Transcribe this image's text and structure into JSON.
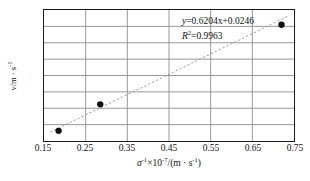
{
  "chart_data": {
    "type": "scatter",
    "title": "",
    "xlabel": "σ⁻¹×10⁻⁷/(m · s⁻¹)",
    "ylabel": "v/m · s⁻¹",
    "xlim": [
      0.15,
      0.75
    ],
    "ylim": [
      0.1,
      0.5
    ],
    "xticks": [
      "0.15",
      "0.25",
      "0.35",
      "0.45",
      "0.55",
      "0.65",
      "0.75"
    ],
    "xtick_values": [
      0.15,
      0.25,
      0.35,
      0.45,
      0.55,
      0.65,
      0.75
    ],
    "yticks": [
      "0.10",
      "0.15",
      "0.20",
      "0.25",
      "0.30",
      "0.35",
      "0.40",
      "0.45",
      "0.50"
    ],
    "ytick_values": [
      0.1,
      0.15,
      0.2,
      0.25,
      0.3,
      0.35,
      0.4,
      0.45,
      0.5
    ],
    "grid": true,
    "legend": "none",
    "points": [
      {
        "x": 0.185,
        "y": 0.131
      },
      {
        "x": 0.285,
        "y": 0.212
      },
      {
        "x": 0.72,
        "y": 0.455
      }
    ],
    "trendline": {
      "style": "dashed",
      "slope": 0.6204,
      "intercept": 0.0246,
      "x_start": 0.165,
      "x_end": 0.735
    },
    "annotations": {
      "equation_y": "y",
      "equation_rest": "=0.6204x+0.0246",
      "r2_symbol": "R",
      "r2_sup": "2",
      "r2_rest": "=0.9963"
    },
    "colors": {
      "frame": "#1a1a1a",
      "grid": "#8c8c8c",
      "marker": "#101010",
      "trend": "#9a9a9a",
      "text": "#111111",
      "background": "#ffffff"
    }
  },
  "axis_text": {
    "y_label_main": "v/m · s",
    "y_label_sup": "-1",
    "x_label_sigma": "σ",
    "x_label_sigma_sup": "-1",
    "x_label_times": "×10",
    "x_label_exp_sup": "-7",
    "x_label_tail": "/(m · s",
    "x_label_tail_sup": "-1",
    "x_label_close": ")"
  }
}
